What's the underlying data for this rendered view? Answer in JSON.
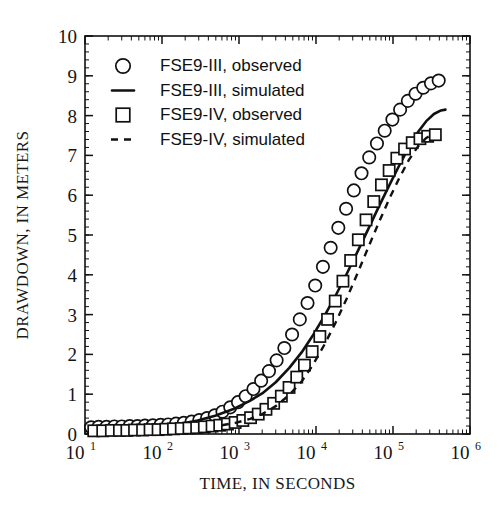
{
  "chart_data": {
    "type": "line",
    "title": "",
    "xlabel": "TIME, IN SECONDS",
    "ylabel": "DRAWDOWN, IN METERS",
    "xscale": "log",
    "yscale": "linear",
    "xlim": [
      10,
      1000000
    ],
    "ylim": [
      0,
      10
    ],
    "xticks": [
      10,
      100,
      1000,
      10000,
      100000,
      1000000
    ],
    "xtick_labels": [
      "10¹",
      "10²",
      "10³",
      "10⁴",
      "10⁵",
      "10⁶"
    ],
    "xtick_bases": [
      "10",
      "10",
      "10",
      "10",
      "10",
      "10"
    ],
    "xtick_exponents": [
      "1",
      "2",
      "3",
      "4",
      "5",
      "6"
    ],
    "yticks": [
      0,
      1,
      2,
      3,
      4,
      5,
      6,
      7,
      8,
      9,
      10
    ],
    "ytick_labels": [
      "0",
      "1",
      "2",
      "3",
      "4",
      "5",
      "6",
      "7",
      "8",
      "9",
      "10"
    ],
    "grid": false,
    "minor_ticks": true,
    "legend_position": "upper-left-inside",
    "series": [
      {
        "name": "FSE9-III, observed",
        "style": "markers",
        "marker": "circle",
        "color": "#111111",
        "points": [
          [
            12,
            0.17
          ],
          [
            15,
            0.18
          ],
          [
            19,
            0.18
          ],
          [
            24,
            0.19
          ],
          [
            30,
            0.19
          ],
          [
            38,
            0.2
          ],
          [
            48,
            0.2
          ],
          [
            60,
            0.21
          ],
          [
            76,
            0.22
          ],
          [
            96,
            0.23
          ],
          [
            120,
            0.24
          ],
          [
            152,
            0.26
          ],
          [
            192,
            0.28
          ],
          [
            242,
            0.31
          ],
          [
            305,
            0.35
          ],
          [
            385,
            0.4
          ],
          [
            485,
            0.47
          ],
          [
            610,
            0.56
          ],
          [
            770,
            0.67
          ],
          [
            970,
            0.8
          ],
          [
            1220,
            0.95
          ],
          [
            1540,
            1.13
          ],
          [
            1940,
            1.34
          ],
          [
            2450,
            1.58
          ],
          [
            3080,
            1.85
          ],
          [
            3880,
            2.16
          ],
          [
            4890,
            2.5
          ],
          [
            6160,
            2.88
          ],
          [
            7760,
            3.29
          ],
          [
            9770,
            3.73
          ],
          [
            12300,
            4.2
          ],
          [
            15500,
            4.68
          ],
          [
            19500,
            5.18
          ],
          [
            24600,
            5.66
          ],
          [
            31000,
            6.12
          ],
          [
            39000,
            6.55
          ],
          [
            49100,
            6.95
          ],
          [
            61900,
            7.3
          ],
          [
            78000,
            7.62
          ],
          [
            98200,
            7.9
          ],
          [
            123700,
            8.15
          ],
          [
            155800,
            8.37
          ],
          [
            196200,
            8.55
          ],
          [
            247200,
            8.7
          ],
          [
            311400,
            8.81
          ],
          [
            392200,
            8.88
          ]
        ]
      },
      {
        "name": "FSE9-III, simulated",
        "style": "line",
        "linestyle": "solid",
        "color": "#111111",
        "points": [
          [
            12,
            0.04
          ],
          [
            20,
            0.06
          ],
          [
            35,
            0.09
          ],
          [
            60,
            0.13
          ],
          [
            100,
            0.18
          ],
          [
            170,
            0.25
          ],
          [
            290,
            0.34
          ],
          [
            490,
            0.46
          ],
          [
            830,
            0.62
          ],
          [
            1400,
            0.84
          ],
          [
            2000,
            1.02
          ],
          [
            3000,
            1.3
          ],
          [
            4500,
            1.66
          ],
          [
            6500,
            2.05
          ],
          [
            9000,
            2.46
          ],
          [
            13000,
            2.98
          ],
          [
            18000,
            3.48
          ],
          [
            25000,
            4.02
          ],
          [
            35000,
            4.6
          ],
          [
            48000,
            5.16
          ],
          [
            65000,
            5.7
          ],
          [
            90000,
            6.26
          ],
          [
            120000,
            6.74
          ],
          [
            160000,
            7.2
          ],
          [
            210000,
            7.58
          ],
          [
            270000,
            7.86
          ],
          [
            340000,
            8.04
          ],
          [
            420000,
            8.13
          ],
          [
            480000,
            8.15
          ]
        ]
      },
      {
        "name": "FSE9-IV, observed",
        "style": "markers",
        "marker": "square",
        "color": "#111111",
        "points": [
          [
            13,
            0.08
          ],
          [
            17,
            0.08
          ],
          [
            22,
            0.09
          ],
          [
            28,
            0.09
          ],
          [
            35,
            0.09
          ],
          [
            44,
            0.1
          ],
          [
            56,
            0.1
          ],
          [
            70,
            0.11
          ],
          [
            89,
            0.11
          ],
          [
            112,
            0.12
          ],
          [
            141,
            0.13
          ],
          [
            178,
            0.14
          ],
          [
            224,
            0.15
          ],
          [
            282,
            0.16
          ],
          [
            355,
            0.18
          ],
          [
            447,
            0.2
          ],
          [
            562,
            0.22
          ],
          [
            708,
            0.25
          ],
          [
            891,
            0.29
          ],
          [
            1122,
            0.34
          ],
          [
            1413,
            0.41
          ],
          [
            1778,
            0.5
          ],
          [
            2239,
            0.62
          ],
          [
            2818,
            0.77
          ],
          [
            3548,
            0.95
          ],
          [
            4467,
            1.17
          ],
          [
            5623,
            1.43
          ],
          [
            7079,
            1.73
          ],
          [
            8913,
            2.07
          ],
          [
            11220,
            2.45
          ],
          [
            14130,
            2.88
          ],
          [
            17780,
            3.34
          ],
          [
            22390,
            3.84
          ],
          [
            28180,
            4.36
          ],
          [
            35480,
            4.88
          ],
          [
            44670,
            5.38
          ],
          [
            56230,
            5.84
          ],
          [
            70790,
            6.26
          ],
          [
            89130,
            6.62
          ],
          [
            112200,
            6.93
          ],
          [
            141300,
            7.16
          ],
          [
            177800,
            7.32
          ],
          [
            223900,
            7.42
          ],
          [
            281800,
            7.48
          ],
          [
            354800,
            7.52
          ]
        ]
      },
      {
        "name": "FSE9-IV, simulated",
        "style": "line",
        "linestyle": "dashed",
        "color": "#111111",
        "points": [
          [
            600,
            0.22
          ],
          [
            900,
            0.28
          ],
          [
            1400,
            0.38
          ],
          [
            2000,
            0.5
          ],
          [
            3000,
            0.7
          ],
          [
            4500,
            0.98
          ],
          [
            6500,
            1.32
          ],
          [
            9000,
            1.72
          ],
          [
            13000,
            2.26
          ],
          [
            18000,
            2.8
          ],
          [
            25000,
            3.4
          ],
          [
            35000,
            4.06
          ],
          [
            48000,
            4.7
          ],
          [
            65000,
            5.3
          ],
          [
            90000,
            5.92
          ],
          [
            120000,
            6.42
          ],
          [
            160000,
            6.88
          ],
          [
            210000,
            7.22
          ],
          [
            270000,
            7.44
          ],
          [
            340000,
            7.54
          ]
        ]
      }
    ]
  },
  "legend": {
    "entries": [
      {
        "label": "FSE9-III, observed",
        "symbol": "circle"
      },
      {
        "label": "FSE9-III, simulated",
        "symbol": "solid-line"
      },
      {
        "label": "FSE9-IV, observed",
        "symbol": "square"
      },
      {
        "label": "FSE9-IV, simulated",
        "symbol": "dashed-line"
      }
    ]
  }
}
